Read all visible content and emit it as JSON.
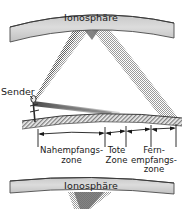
{
  "diagram": {
    "title_top": "Ionosphäre",
    "title_bottom": "Ionosphäre",
    "transmitter_label": "Sender",
    "zones": [
      {
        "name": "near-reception-zone",
        "line1": "Nahempfangs-",
        "line2": "zone",
        "line3": ""
      },
      {
        "name": "dead-zone",
        "line1": "Tote",
        "line2": "Zone",
        "line3": ""
      },
      {
        "name": "far-reception-zone",
        "line1": "Fern-",
        "line2": "empfangs-",
        "line3": "zone"
      }
    ],
    "colors": {
      "band_fill": "#d2d2d2",
      "band_stroke": "#4a4a4a",
      "beam_light": "#b9b9b9",
      "beam_dark": "#5d5d5d",
      "ground_hatch": "#8e8e8e",
      "text": "#1a1a1a",
      "background": "#ffffff"
    }
  }
}
